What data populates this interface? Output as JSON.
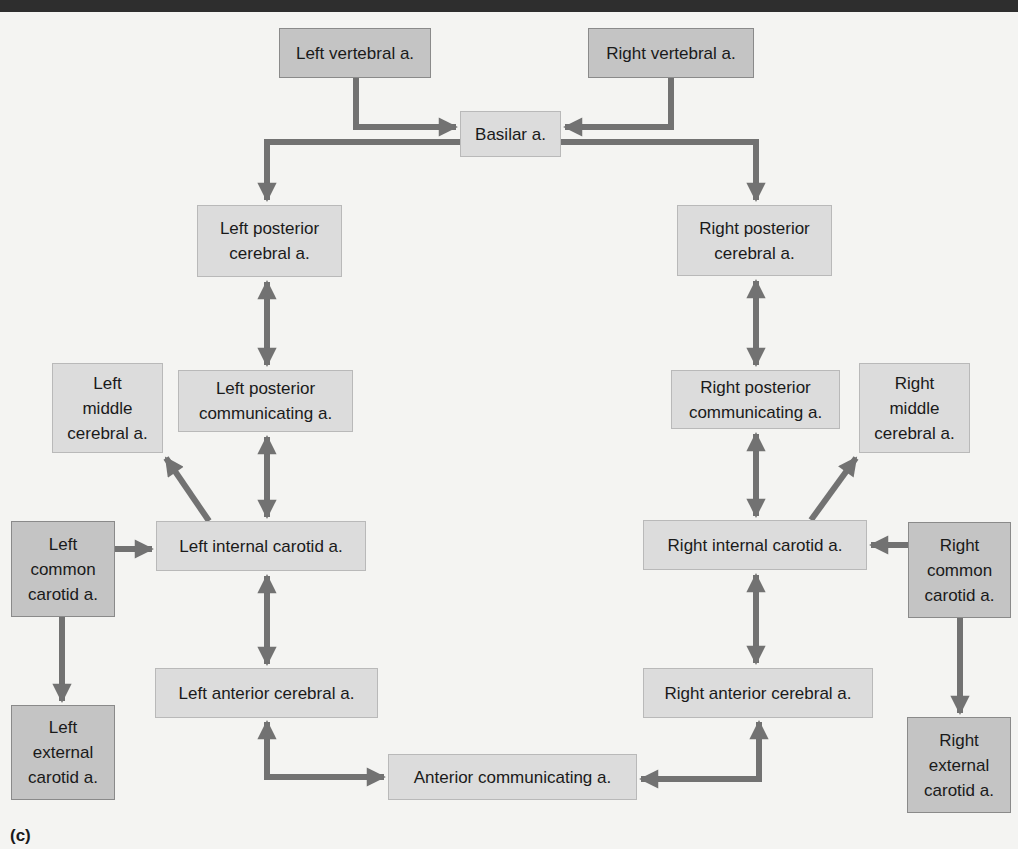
{
  "figure": {
    "panel_label": "(c)",
    "colors": {
      "background": "#f4f4f2",
      "box_light": "#dcdcdc",
      "box_dark": "#c4c4c4",
      "arrow": "#727272",
      "topbar": "#2e2e2e"
    }
  },
  "nodes": {
    "left_vertebral": "Left vertebral a.",
    "right_vertebral": "Right vertebral a.",
    "basilar": "Basilar a.",
    "left_posterior_cerebral": "Left posterior\ncerebral a.",
    "right_posterior_cerebral": "Right posterior\ncerebral a.",
    "left_middle_cerebral": "Left\nmiddle\ncerebral a.",
    "left_posterior_communicating": "Left posterior\ncommunicating a.",
    "right_posterior_communicating": "Right posterior\ncommunicating a.",
    "right_middle_cerebral": "Right\nmiddle\ncerebral a.",
    "left_common_carotid": "Left\ncommon\ncarotid a.",
    "left_internal_carotid": "Left internal carotid a.",
    "right_internal_carotid": "Right internal carotid a.",
    "right_common_carotid": "Right\ncommon\ncarotid a.",
    "left_anterior_cerebral": "Left anterior cerebral a.",
    "right_anterior_cerebral": "Right anterior cerebral a.",
    "left_external_carotid": "Left\nexternal\ncarotid a.",
    "right_external_carotid": "Right\nexternal\ncarotid a.",
    "anterior_communicating": "Anterior communicating a."
  },
  "edges": [
    {
      "from": "Left vertebral a.",
      "to": "Basilar a.",
      "type": "one-way"
    },
    {
      "from": "Right vertebral a.",
      "to": "Basilar a.",
      "type": "one-way"
    },
    {
      "from": "Basilar a.",
      "to": "Left posterior cerebral a.",
      "type": "one-way"
    },
    {
      "from": "Basilar a.",
      "to": "Right posterior cerebral a.",
      "type": "one-way"
    },
    {
      "from": "Left posterior cerebral a.",
      "to": "Left posterior communicating a.",
      "type": "two-way"
    },
    {
      "from": "Right posterior cerebral a.",
      "to": "Right posterior communicating a.",
      "type": "two-way"
    },
    {
      "from": "Left posterior communicating a.",
      "to": "Left internal carotid a.",
      "type": "two-way"
    },
    {
      "from": "Right posterior communicating a.",
      "to": "Right internal carotid a.",
      "type": "two-way"
    },
    {
      "from": "Left internal carotid a.",
      "to": "Left middle cerebral a.",
      "type": "one-way"
    },
    {
      "from": "Right internal carotid a.",
      "to": "Right middle cerebral a.",
      "type": "one-way"
    },
    {
      "from": "Left common carotid a.",
      "to": "Left internal carotid a.",
      "type": "one-way"
    },
    {
      "from": "Right common carotid a.",
      "to": "Right internal carotid a.",
      "type": "one-way"
    },
    {
      "from": "Left common carotid a.",
      "to": "Left external carotid a.",
      "type": "one-way"
    },
    {
      "from": "Right common carotid a.",
      "to": "Right external carotid a.",
      "type": "one-way"
    },
    {
      "from": "Left internal carotid a.",
      "to": "Left anterior cerebral a.",
      "type": "two-way"
    },
    {
      "from": "Right internal carotid a.",
      "to": "Right anterior cerebral a.",
      "type": "two-way"
    },
    {
      "from": "Left anterior cerebral a.",
      "to": "Anterior communicating a.",
      "type": "two-way"
    },
    {
      "from": "Right anterior cerebral a.",
      "to": "Anterior communicating a.",
      "type": "two-way"
    }
  ]
}
